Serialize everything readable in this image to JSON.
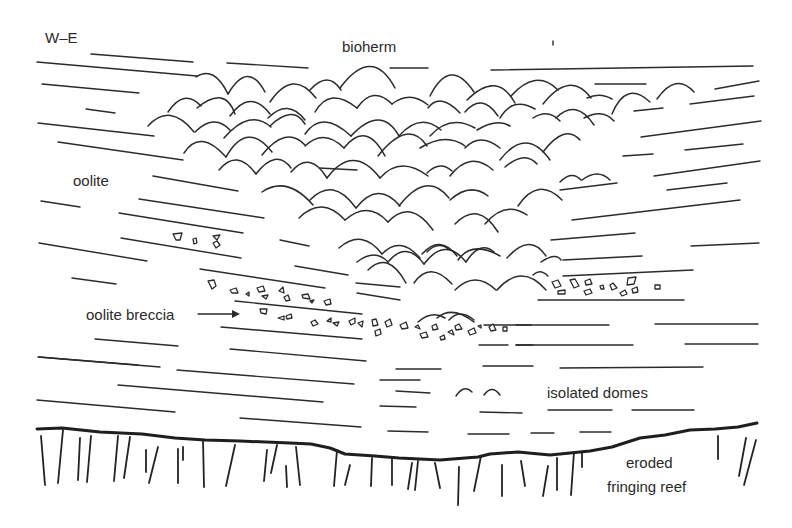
{
  "diagram": {
    "orientation_label": "W–E",
    "labels": {
      "bioherm": "bioherm",
      "oolite": "oolite",
      "oolite_breccia": "oolite breccia",
      "isolated_domes": "isolated domes",
      "eroded_line1": "eroded",
      "eroded_line2": "fringing reef"
    },
    "units": [
      {
        "name": "bioherm",
        "symbol": "stacked domes (stromatolite/coral heads)"
      },
      {
        "name": "oolite",
        "symbol": "inclined bedding lines"
      },
      {
        "name": "oolite breccia",
        "symbol": "angular clasts between beds"
      },
      {
        "name": "isolated domes",
        "symbol": "small single domes in bedded oolite"
      },
      {
        "name": "eroded fringing reef",
        "symbol": "vertical ticks below thick erosion surface"
      }
    ],
    "colors": {
      "ink": "#2b2b2b",
      "background": "#ffffff"
    }
  }
}
